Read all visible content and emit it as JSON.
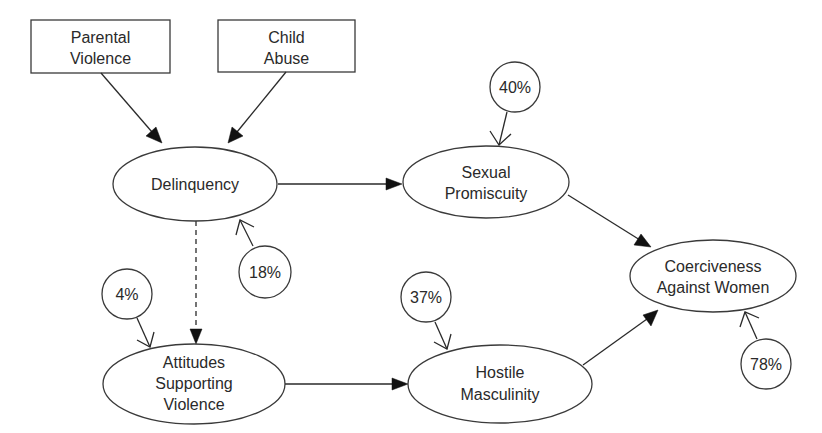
{
  "diagram": {
    "type": "path-model",
    "boxes": [
      {
        "id": "parental_violence",
        "lines": [
          "Parental",
          "Violence"
        ]
      },
      {
        "id": "child_abuse",
        "lines": [
          "Child",
          "Abuse"
        ]
      }
    ],
    "nodes": [
      {
        "id": "delinquency",
        "lines": [
          "Delinquency"
        ],
        "variance_explained": "18%"
      },
      {
        "id": "sexual_promiscuity",
        "lines": [
          "Sexual",
          "Promiscuity"
        ],
        "variance_explained": "40%"
      },
      {
        "id": "attitudes_supporting_violence",
        "lines": [
          "Attitudes",
          "Supporting",
          "Violence"
        ],
        "variance_explained": "4%"
      },
      {
        "id": "hostile_masculinity",
        "lines": [
          "Hostile",
          "Masculinity"
        ],
        "variance_explained": "37%"
      },
      {
        "id": "coerciveness_against_women",
        "lines": [
          "Coerciveness",
          "Against Women"
        ],
        "variance_explained": "78%"
      }
    ],
    "edges": [
      {
        "from": "parental_violence",
        "to": "delinquency",
        "style": "solid"
      },
      {
        "from": "child_abuse",
        "to": "delinquency",
        "style": "solid"
      },
      {
        "from": "delinquency",
        "to": "sexual_promiscuity",
        "style": "solid"
      },
      {
        "from": "delinquency",
        "to": "attitudes_supporting_violence",
        "style": "dashed"
      },
      {
        "from": "attitudes_supporting_violence",
        "to": "hostile_masculinity",
        "style": "solid"
      },
      {
        "from": "sexual_promiscuity",
        "to": "coerciveness_against_women",
        "style": "solid"
      },
      {
        "from": "hostile_masculinity",
        "to": "coerciveness_against_women",
        "style": "solid"
      }
    ],
    "labels": {
      "parental_violence_1": "Parental",
      "parental_violence_2": "Violence",
      "child_abuse_1": "Child",
      "child_abuse_2": "Abuse",
      "delinquency_1": "Delinquency",
      "sexual_promiscuity_1": "Sexual",
      "sexual_promiscuity_2": "Promiscuity",
      "attitudes_1": "Attitudes",
      "attitudes_2": "Supporting",
      "attitudes_3": "Violence",
      "hostile_1": "Hostile",
      "hostile_2": "Masculinity",
      "coerciveness_1": "Coerciveness",
      "coerciveness_2": "Against Women",
      "pct_delinquency": "18%",
      "pct_sexual_promiscuity": "40%",
      "pct_attitudes": "4%",
      "pct_hostile": "37%",
      "pct_coerciveness": "78%"
    }
  }
}
